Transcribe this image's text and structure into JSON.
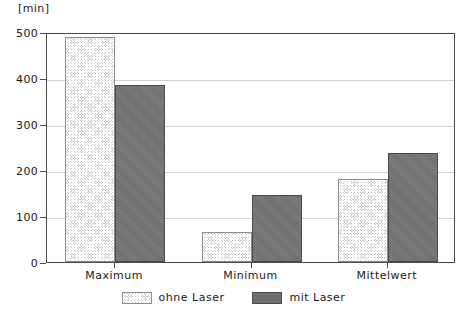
{
  "chart_data": {
    "type": "bar",
    "title": "",
    "subtitle": "",
    "xlabel": "",
    "ylabel": "[min]",
    "unit_label": "[min]",
    "categories": [
      "Maximum",
      "Minimum",
      "Mittelwert"
    ],
    "series": [
      {
        "name": "ohne Laser",
        "values": [
          490,
          65,
          180
        ],
        "color": "#c9c9c9",
        "pattern": "cross-hatch"
      },
      {
        "name": "mit Laser",
        "values": [
          385,
          145,
          238
        ],
        "color": "#6e6e6e",
        "pattern": "solid-dark"
      }
    ],
    "ylim": [
      0,
      500
    ],
    "yticks": [
      0,
      100,
      200,
      300,
      400,
      500
    ],
    "ytick_labels": [
      "0",
      "100",
      "200",
      "300",
      "400",
      "500"
    ],
    "grid": true,
    "grid_axis": "y",
    "legend_position": "bottom-center",
    "legend_entries": [
      "ohne Laser",
      "mit Laser"
    ],
    "annotations": []
  },
  "colors": {
    "axis": "#4a4a4a",
    "grid": "#d2d2d2",
    "series_light": "#c9c9c9",
    "series_dark": "#6e6e6e",
    "background": "#ffffff",
    "text": "#1a1a1a"
  }
}
